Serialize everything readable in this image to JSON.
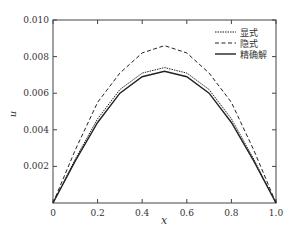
{
  "chart_data": {
    "type": "line",
    "title": "",
    "xlabel": "x",
    "ylabel": "u",
    "xlim": [
      0,
      1.0
    ],
    "ylim": [
      0,
      0.01
    ],
    "xticks": [
      "0",
      "0.2",
      "0.4",
      "0.6",
      "0.8",
      "1.0"
    ],
    "yticks": [
      "0.002",
      "0.004",
      "0.006",
      "0.008",
      "0.010"
    ],
    "grid": false,
    "legend_position": "upper right",
    "x": [
      0,
      0.1,
      0.2,
      0.3,
      0.4,
      0.5,
      0.6,
      0.7,
      0.8,
      0.9,
      1.0
    ],
    "series": [
      {
        "name": "显式",
        "style": "dotted",
        "values": [
          0,
          0.0024,
          0.0046,
          0.0062,
          0.0071,
          0.0074,
          0.0071,
          0.0062,
          0.0046,
          0.0024,
          0
        ]
      },
      {
        "name": "隐式",
        "style": "dashed",
        "values": [
          0,
          0.0029,
          0.0055,
          0.0071,
          0.0082,
          0.0086,
          0.0082,
          0.0071,
          0.0055,
          0.0029,
          0
        ]
      },
      {
        "name": "精确解",
        "style": "solid",
        "values": [
          0,
          0.0023,
          0.0044,
          0.006,
          0.0069,
          0.0072,
          0.0069,
          0.006,
          0.0044,
          0.0023,
          0
        ]
      }
    ]
  }
}
